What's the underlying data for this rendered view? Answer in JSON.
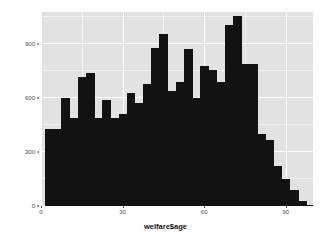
{
  "chart_data": {
    "type": "bar",
    "title": "",
    "subtitle": "",
    "xlabel": "welfare$age",
    "ylabel": "",
    "xlim": [
      0,
      100
    ],
    "ylim": [
      0,
      1080
    ],
    "grid": true,
    "legend": null,
    "bar_color": "#121212",
    "panel_color": "#e2e2e2",
    "grid_color": "#ffffff",
    "binwidth": 3,
    "x_ticks": [
      0,
      30,
      60,
      90
    ],
    "y_ticks": [
      0,
      300,
      600,
      900
    ],
    "x_tick_labels": [
      "0",
      "30",
      "60",
      "90"
    ],
    "y_tick_labels": [
      "0",
      "300",
      "600",
      "900"
    ],
    "categories": [
      3,
      6,
      9,
      12,
      15,
      18,
      21,
      24,
      27,
      30,
      33,
      36,
      39,
      42,
      45,
      48,
      51,
      54,
      57,
      60,
      63,
      66,
      69,
      72,
      75,
      78,
      81,
      84,
      87,
      90,
      93,
      96,
      99
    ],
    "values": [
      430,
      430,
      600,
      490,
      720,
      740,
      490,
      590,
      490,
      510,
      630,
      575,
      680,
      880,
      960,
      640,
      690,
      875,
      600,
      780,
      755,
      690,
      1010,
      1060,
      790,
      790,
      400,
      370,
      220,
      150,
      90,
      30,
      8
    ]
  },
  "axis": {
    "x_title": "welfare$age"
  }
}
